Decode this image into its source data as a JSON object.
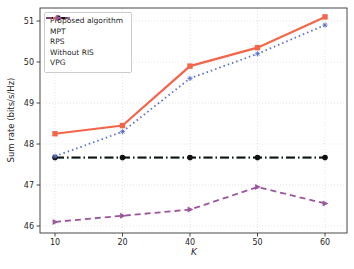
{
  "figure": {
    "title": ""
  },
  "chart_data": {
    "type": "line",
    "title": "",
    "xlabel": "K",
    "ylabel": "Sum rate (bits/s/Hz)",
    "x_tick_labels": [
      "10",
      "20",
      "40",
      "50",
      "60"
    ],
    "y_tick_labels": [
      "46",
      "47",
      "48",
      "49",
      "50",
      "51"
    ],
    "ylim": [
      45.83,
      51.32
    ],
    "grid": true,
    "grid_style": "dotted",
    "legend_position": "upper left",
    "categories": [
      10,
      20,
      40,
      50,
      60
    ],
    "series": [
      {
        "name": "Proposed algorithm",
        "color": "#f4664a",
        "line_style": "solid",
        "marker": "square",
        "values": [
          48.25,
          48.45,
          49.9,
          50.35,
          51.1
        ]
      },
      {
        "name": "MPT",
        "color": "#5a6fc9",
        "line_style": "dotted",
        "marker": "star",
        "values": [
          47.7,
          48.3,
          49.6,
          50.2,
          50.9
        ]
      },
      {
        "name": "RPS",
        "color": "#9fd8d4",
        "line_style": "dashdot",
        "marker": "triangle-down",
        "values": [
          47.65,
          47.65,
          47.65,
          47.65,
          47.65
        ]
      },
      {
        "name": "Without RIS",
        "color": "#111111",
        "line_style": "dashdot",
        "marker": "circle",
        "values": [
          47.67,
          47.67,
          47.67,
          47.67,
          47.67
        ]
      },
      {
        "name": "VPG",
        "color": "#9c549c",
        "line_style": "dashed",
        "marker": "triangle-right",
        "values": [
          46.1,
          46.25,
          46.4,
          46.95,
          46.55
        ]
      }
    ]
  }
}
